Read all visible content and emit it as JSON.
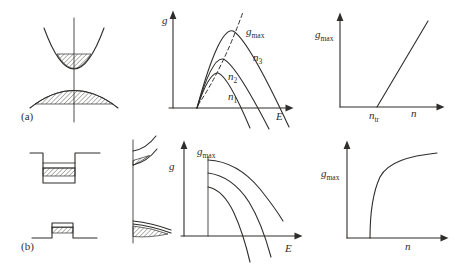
{
  "colors": {
    "ink": "#2e2d2b",
    "background": "#ffffff"
  },
  "panel_a": {
    "label": "(a)"
  },
  "panel_b": {
    "label": "(b)"
  },
  "bulk_gain_plot": {
    "ylabel": "g",
    "xlabel": "E",
    "peak_envelope_label": {
      "base": "g",
      "sub": "max"
    },
    "curve_labels": [
      {
        "base": "n",
        "sub": "1"
      },
      {
        "base": "n",
        "sub": "2"
      },
      {
        "base": "n",
        "sub": "3"
      }
    ]
  },
  "bulk_gmax_plot": {
    "ylabel": {
      "base": "g",
      "sub": "max"
    },
    "xlabel": "n",
    "transparency_label": {
      "base": "n",
      "sub": "tr"
    }
  },
  "qw_gain_plot": {
    "ylabel": "g",
    "xlabel": "E",
    "peak_label": {
      "base": "g",
      "sub": "max"
    }
  },
  "qw_gmax_plot": {
    "ylabel": {
      "base": "g",
      "sub": "max"
    },
    "xlabel": "n"
  }
}
